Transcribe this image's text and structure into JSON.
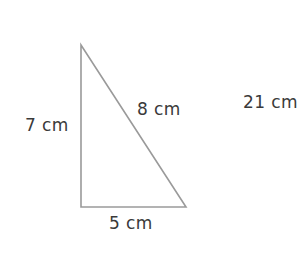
{
  "figure": {
    "type": "right-triangle-diagram",
    "background_color": "#ffffff",
    "stroke_color": "#9a9a9a",
    "text_color": "#3a3a3a",
    "labels": {
      "vertical_leg": "7 cm",
      "hypotenuse": "8 cm",
      "base_leg": "5 cm"
    },
    "answer_text": "21 cm",
    "geometry": {
      "apex": [
        81,
        45
      ],
      "bottom_left": [
        81,
        207
      ],
      "bottom_right": [
        186,
        207
      ]
    }
  }
}
